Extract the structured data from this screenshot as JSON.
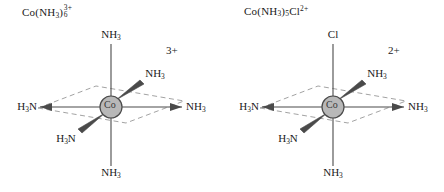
{
  "diagram": {
    "title_visible": false,
    "type": "octahedral-coordination-complex-pair",
    "colors": {
      "bond": "#4a4a4a",
      "plane_dashed": "#8a8a8a",
      "metal_fill": "#b8b8b8",
      "metal_stroke": "#4a4a4a",
      "text": "#1a1a1a",
      "background": "#ffffff"
    }
  },
  "complexes": [
    {
      "id": "hexaamminecobalt",
      "formula": {
        "element": "Co",
        "open_paren": "(",
        "ligand": "NH",
        "ligand_sub": "3",
        "close_paren": ")",
        "count": "6",
        "charge": "3+"
      },
      "charge_label": "3+",
      "metal_label": "Co",
      "ligands": {
        "top": "NH3",
        "bottom": "NH3",
        "left": "H3N",
        "right": "NH3",
        "upper_right": "NH3",
        "lower_left": "H3N"
      },
      "ligand_text": {
        "top": {
          "lead": "NH",
          "sub": "3"
        },
        "bottom": {
          "lead": "NH",
          "sub": "3"
        },
        "left": {
          "lead": "H",
          "sub": "3",
          "tail": "N"
        },
        "right": {
          "lead": "NH",
          "sub": "3"
        },
        "upper_right": {
          "lead": "NH",
          "sub": "3"
        },
        "lower_left": {
          "lead": "H",
          "sub": "3",
          "tail": "N"
        }
      }
    },
    {
      "id": "chloropentaamminecobalt",
      "formula": {
        "element": "Co",
        "open_paren": "(",
        "ligand": "NH",
        "ligand_sub": "3",
        "close_paren": ")",
        "count": "5",
        "extra": "Cl",
        "charge": "2+"
      },
      "charge_label": "2+",
      "metal_label": "Co",
      "ligands": {
        "top": "Cl",
        "bottom": "NH3",
        "left": "H3N",
        "right": "NH3",
        "upper_right": "NH3",
        "lower_left": "H3N"
      },
      "ligand_text": {
        "top": {
          "lead": "Cl",
          "sub": ""
        },
        "bottom": {
          "lead": "NH",
          "sub": "3"
        },
        "left": {
          "lead": "H",
          "sub": "3",
          "tail": "N"
        },
        "right": {
          "lead": "NH",
          "sub": "3"
        },
        "upper_right": {
          "lead": "NH",
          "sub": "3"
        },
        "lower_left": {
          "lead": "H",
          "sub": "3",
          "tail": "N"
        }
      }
    }
  ]
}
